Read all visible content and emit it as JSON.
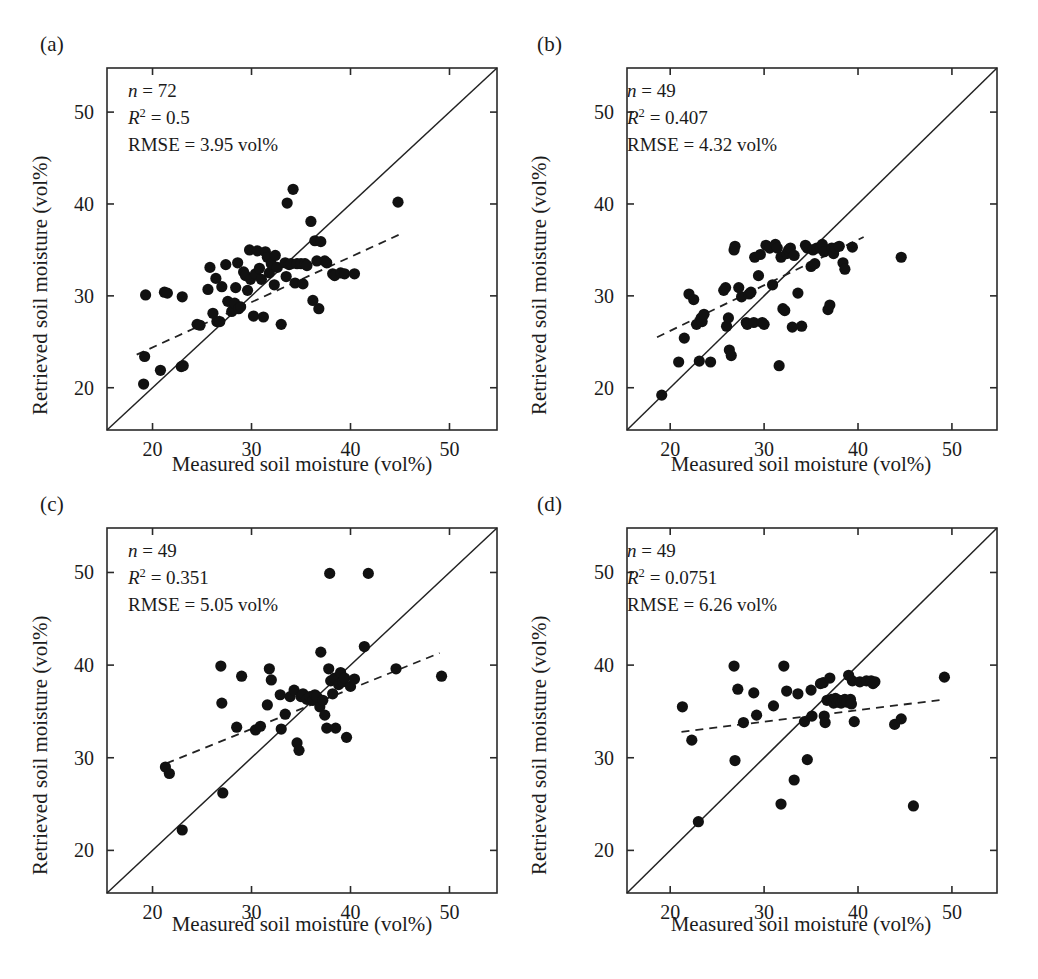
{
  "figure": {
    "panel_count": 4,
    "background_color": "#ffffff",
    "point_color": "#111111",
    "line_color": "#222222"
  },
  "axes": {
    "xlabel": "Measured soil moisture (vol%)",
    "ylabel": "Retrieved soil moisture (vol%)",
    "xticks": [
      "20",
      "30",
      "40",
      "50"
    ],
    "yticks": [
      "20",
      "30",
      "40",
      "50"
    ],
    "xlim": [
      15.4,
      54.8
    ],
    "ylim": [
      15.4,
      54.8
    ]
  },
  "labels": {
    "a": "(a)",
    "b": "(b)",
    "c": "(c)",
    "d": "(d)"
  },
  "stats": {
    "a": {
      "n_label": "n",
      "n_value": "= 72",
      "r2_label": "R",
      "r2_value": "= 0.5",
      "rmse": "RMSE = 3.95 vol%"
    },
    "b": {
      "n_label": "n",
      "n_value": "= 49",
      "r2_label": "R",
      "r2_value": "= 0.407",
      "rmse": "RMSE = 4.32 vol%"
    },
    "c": {
      "n_label": "n",
      "n_value": "= 49",
      "r2_label": "R",
      "r2_value": "= 0.351",
      "rmse": "RMSE = 5.05 vol%"
    },
    "d": {
      "n_label": "n",
      "n_value": "= 49",
      "r2_label": "R",
      "r2_value": "= 0.0751",
      "rmse": "RMSE = 6.26 vol%"
    }
  },
  "chart_data": [
    {
      "id": "a",
      "type": "scatter",
      "title": "(a)",
      "xlabel": "Measured soil moisture (vol%)",
      "ylabel": "Retrieved soil moisture (vol%)",
      "xlim": [
        15.4,
        54.8
      ],
      "ylim": [
        15.4,
        54.8
      ],
      "xticks": [
        20,
        30,
        40,
        50
      ],
      "yticks": [
        20,
        30,
        40,
        50
      ],
      "grid": false,
      "legend": null,
      "n": 72,
      "r_squared": 0.5,
      "rmse": 3.95,
      "rmse_units": "vol%",
      "one_to_one_line": {
        "from": [
          15.4,
          15.4
        ],
        "to": [
          54.8,
          54.8
        ],
        "style": "solid"
      },
      "fit_line": {
        "from": [
          18.4,
          23.6
        ],
        "to": [
          45.2,
          36.8
        ],
        "style": "dashed"
      },
      "points": [
        [
          19.1,
          20.4
        ],
        [
          19.2,
          23.4
        ],
        [
          19.3,
          30.1
        ],
        [
          20.8,
          21.9
        ],
        [
          21.2,
          30.4
        ],
        [
          21.5,
          30.3
        ],
        [
          22.9,
          22.3
        ],
        [
          23.0,
          29.9
        ],
        [
          23.1,
          22.4
        ],
        [
          24.5,
          26.9
        ],
        [
          24.8,
          26.8
        ],
        [
          25.6,
          30.7
        ],
        [
          25.8,
          33.1
        ],
        [
          26.1,
          28.1
        ],
        [
          26.4,
          31.9
        ],
        [
          26.5,
          27.2
        ],
        [
          26.8,
          27.2
        ],
        [
          27.0,
          31.0
        ],
        [
          27.4,
          33.4
        ],
        [
          27.6,
          29.4
        ],
        [
          28.0,
          28.3
        ],
        [
          28.2,
          28.6
        ],
        [
          28.3,
          29.2
        ],
        [
          28.4,
          30.9
        ],
        [
          28.6,
          33.6
        ],
        [
          28.7,
          28.6
        ],
        [
          28.9,
          28.8
        ],
        [
          29.2,
          32.6
        ],
        [
          29.4,
          32.2
        ],
        [
          29.6,
          30.6
        ],
        [
          29.8,
          35.0
        ],
        [
          29.9,
          31.8
        ],
        [
          30.2,
          27.8
        ],
        [
          30.4,
          32.4
        ],
        [
          30.6,
          34.9
        ],
        [
          30.8,
          33.0
        ],
        [
          31.0,
          31.8
        ],
        [
          31.2,
          27.7
        ],
        [
          31.4,
          34.8
        ],
        [
          31.6,
          34.2
        ],
        [
          31.8,
          32.5
        ],
        [
          32.0,
          33.5
        ],
        [
          32.3,
          31.2
        ],
        [
          32.4,
          34.4
        ],
        [
          32.6,
          33.1
        ],
        [
          33.0,
          26.9
        ],
        [
          33.4,
          33.6
        ],
        [
          33.5,
          32.1
        ],
        [
          33.6,
          40.1
        ],
        [
          33.8,
          33.4
        ],
        [
          34.0,
          33.5
        ],
        [
          34.2,
          41.6
        ],
        [
          34.4,
          31.4
        ],
        [
          34.6,
          33.5
        ],
        [
          35.0,
          33.5
        ],
        [
          35.2,
          31.3
        ],
        [
          35.4,
          33.5
        ],
        [
          35.6,
          33.3
        ],
        [
          36.0,
          38.1
        ],
        [
          36.2,
          29.5
        ],
        [
          36.4,
          36.0
        ],
        [
          36.6,
          33.8
        ],
        [
          36.8,
          28.6
        ],
        [
          37.0,
          35.9
        ],
        [
          37.4,
          33.8
        ],
        [
          37.6,
          33.6
        ],
        [
          38.2,
          32.4
        ],
        [
          38.4,
          32.2
        ],
        [
          39.0,
          32.5
        ],
        [
          39.4,
          32.4
        ],
        [
          40.4,
          32.4
        ],
        [
          44.8,
          40.2
        ]
      ]
    },
    {
      "id": "b",
      "type": "scatter",
      "title": "(b)",
      "xlabel": "Measured soil moisture (vol%)",
      "ylabel": "Retrieved soil moisture (vol%)",
      "xlim": [
        15.4,
        54.8
      ],
      "ylim": [
        15.4,
        54.8
      ],
      "xticks": [
        20,
        30,
        40,
        50
      ],
      "yticks": [
        20,
        30,
        40,
        50
      ],
      "grid": false,
      "legend": null,
      "n": 49,
      "r_squared": 0.407,
      "rmse": 4.32,
      "rmse_units": "vol%",
      "one_to_one_line": {
        "from": [
          15.4,
          15.4
        ],
        "to": [
          54.8,
          54.8
        ],
        "style": "solid"
      },
      "fit_line": {
        "from": [
          18.6,
          25.5
        ],
        "to": [
          40.6,
          36.4
        ],
        "style": "dashed"
      },
      "points": [
        [
          19.1,
          19.2
        ],
        [
          20.9,
          22.8
        ],
        [
          21.5,
          25.4
        ],
        [
          22.0,
          30.2
        ],
        [
          22.5,
          29.6
        ],
        [
          22.8,
          26.9
        ],
        [
          23.1,
          22.9
        ],
        [
          23.3,
          27.6
        ],
        [
          23.4,
          27.2
        ],
        [
          23.6,
          28.0
        ],
        [
          24.3,
          22.8
        ],
        [
          25.7,
          30.6
        ],
        [
          25.9,
          30.9
        ],
        [
          26.0,
          26.7
        ],
        [
          26.2,
          27.6
        ],
        [
          26.3,
          24.1
        ],
        [
          26.5,
          23.5
        ],
        [
          26.8,
          35.0
        ],
        [
          26.9,
          35.4
        ],
        [
          27.3,
          30.9
        ],
        [
          27.6,
          29.9
        ],
        [
          28.1,
          27.1
        ],
        [
          28.2,
          26.9
        ],
        [
          28.4,
          30.2
        ],
        [
          28.6,
          30.4
        ],
        [
          28.9,
          27.1
        ],
        [
          29.0,
          34.2
        ],
        [
          29.4,
          32.2
        ],
        [
          29.6,
          34.5
        ],
        [
          29.8,
          27.1
        ],
        [
          30.0,
          26.9
        ],
        [
          30.2,
          35.5
        ],
        [
          30.6,
          35.2
        ],
        [
          30.9,
          31.2
        ],
        [
          31.2,
          35.6
        ],
        [
          31.4,
          35.2
        ],
        [
          31.6,
          22.4
        ],
        [
          31.8,
          34.2
        ],
        [
          32.0,
          28.6
        ],
        [
          32.2,
          28.4
        ],
        [
          32.4,
          34.6
        ],
        [
          32.6,
          35.0
        ],
        [
          32.8,
          35.2
        ],
        [
          33.0,
          26.6
        ],
        [
          33.2,
          34.4
        ],
        [
          33.6,
          30.3
        ],
        [
          34.0,
          26.7
        ],
        [
          34.4,
          35.5
        ],
        [
          34.6,
          35.2
        ],
        [
          35.0,
          33.2
        ],
        [
          35.2,
          35.0
        ],
        [
          35.4,
          33.5
        ],
        [
          35.6,
          35.2
        ],
        [
          36.0,
          35.2
        ],
        [
          36.2,
          35.6
        ],
        [
          36.4,
          34.8
        ],
        [
          36.8,
          28.5
        ],
        [
          37.0,
          29.0
        ],
        [
          37.2,
          35.2
        ],
        [
          37.4,
          34.6
        ],
        [
          37.6,
          35.2
        ],
        [
          38.0,
          35.4
        ],
        [
          38.4,
          33.6
        ],
        [
          38.6,
          32.9
        ],
        [
          39.4,
          35.3
        ],
        [
          44.6,
          34.2
        ]
      ]
    },
    {
      "id": "c",
      "type": "scatter",
      "title": "(c)",
      "xlabel": "Measured soil moisture (vol%)",
      "ylabel": "Retrieved soil moisture (vol%)",
      "xlim": [
        15.4,
        54.8
      ],
      "ylim": [
        15.4,
        54.8
      ],
      "xticks": [
        20,
        30,
        40,
        50
      ],
      "yticks": [
        20,
        30,
        40,
        50
      ],
      "grid": false,
      "legend": null,
      "n": 49,
      "r_squared": 0.351,
      "rmse": 5.05,
      "rmse_units": "vol%",
      "one_to_one_line": {
        "from": [
          15.4,
          15.4
        ],
        "to": [
          54.8,
          54.8
        ],
        "style": "solid"
      },
      "fit_line": {
        "from": [
          21.4,
          29.4
        ],
        "to": [
          49.0,
          41.3
        ],
        "style": "dashed"
      },
      "points": [
        [
          21.3,
          29.0
        ],
        [
          21.7,
          28.3
        ],
        [
          23.0,
          22.2
        ],
        [
          26.9,
          39.9
        ],
        [
          27.0,
          35.9
        ],
        [
          27.1,
          26.2
        ],
        [
          28.5,
          33.3
        ],
        [
          29.0,
          38.8
        ],
        [
          30.4,
          33.0
        ],
        [
          30.9,
          33.4
        ],
        [
          31.6,
          35.7
        ],
        [
          31.8,
          39.6
        ],
        [
          32.0,
          38.4
        ],
        [
          32.9,
          36.8
        ],
        [
          33.0,
          33.1
        ],
        [
          33.4,
          34.7
        ],
        [
          33.9,
          36.6
        ],
        [
          34.3,
          37.3
        ],
        [
          34.6,
          31.6
        ],
        [
          34.8,
          30.8
        ],
        [
          35.0,
          36.6
        ],
        [
          35.2,
          36.9
        ],
        [
          35.6,
          36.3
        ],
        [
          35.9,
          36.6
        ],
        [
          36.2,
          36.2
        ],
        [
          36.4,
          36.8
        ],
        [
          36.6,
          36.6
        ],
        [
          36.9,
          35.5
        ],
        [
          37.0,
          41.4
        ],
        [
          37.2,
          36.2
        ],
        [
          37.4,
          34.6
        ],
        [
          37.6,
          33.2
        ],
        [
          37.8,
          39.6
        ],
        [
          37.9,
          49.9
        ],
        [
          38.0,
          38.3
        ],
        [
          38.2,
          36.9
        ],
        [
          38.4,
          38.6
        ],
        [
          38.5,
          33.2
        ],
        [
          38.8,
          37.9
        ],
        [
          39.0,
          39.2
        ],
        [
          39.2,
          38.2
        ],
        [
          39.4,
          38.6
        ],
        [
          39.6,
          32.2
        ],
        [
          40.0,
          37.7
        ],
        [
          40.4,
          38.5
        ],
        [
          41.4,
          42.0
        ],
        [
          41.8,
          49.9
        ],
        [
          44.6,
          39.6
        ],
        [
          49.2,
          38.8
        ]
      ]
    },
    {
      "id": "d",
      "type": "scatter",
      "title": "(d)",
      "xlabel": "Measured soil moisture (vol%)",
      "ylabel": "Retrieved soil moisture (vol%)",
      "xlim": [
        15.4,
        54.8
      ],
      "ylim": [
        15.4,
        54.8
      ],
      "xticks": [
        20,
        30,
        40,
        50
      ],
      "yticks": [
        20,
        30,
        40,
        50
      ],
      "grid": false,
      "legend": null,
      "n": 49,
      "r_squared": 0.0751,
      "rmse": 6.26,
      "rmse_units": "vol%",
      "one_to_one_line": {
        "from": [
          15.4,
          15.4
        ],
        "to": [
          54.8,
          54.8
        ],
        "style": "solid"
      },
      "fit_line": {
        "from": [
          21.2,
          32.8
        ],
        "to": [
          49.3,
          36.3
        ],
        "style": "dashed"
      },
      "points": [
        [
          21.3,
          35.5
        ],
        [
          22.3,
          31.9
        ],
        [
          23.0,
          23.1
        ],
        [
          26.8,
          39.9
        ],
        [
          26.9,
          29.7
        ],
        [
          27.2,
          37.4
        ],
        [
          27.8,
          33.8
        ],
        [
          28.9,
          37.0
        ],
        [
          29.2,
          34.6
        ],
        [
          31.0,
          35.6
        ],
        [
          31.8,
          25.0
        ],
        [
          32.1,
          39.9
        ],
        [
          32.4,
          37.2
        ],
        [
          33.2,
          27.6
        ],
        [
          33.6,
          36.9
        ],
        [
          34.3,
          33.9
        ],
        [
          34.6,
          29.8
        ],
        [
          35.0,
          37.3
        ],
        [
          35.1,
          34.5
        ],
        [
          36.0,
          38.0
        ],
        [
          36.3,
          38.1
        ],
        [
          36.4,
          34.5
        ],
        [
          36.5,
          33.8
        ],
        [
          36.7,
          36.2
        ],
        [
          37.0,
          38.6
        ],
        [
          37.2,
          36.3
        ],
        [
          37.4,
          35.9
        ],
        [
          37.6,
          36.4
        ],
        [
          37.8,
          36.0
        ],
        [
          38.0,
          36.2
        ],
        [
          38.2,
          35.9
        ],
        [
          38.4,
          36.2
        ],
        [
          38.6,
          36.3
        ],
        [
          38.8,
          36.0
        ],
        [
          39.0,
          38.9
        ],
        [
          39.2,
          36.3
        ],
        [
          39.3,
          35.8
        ],
        [
          39.4,
          38.3
        ],
        [
          39.6,
          33.9
        ],
        [
          40.2,
          38.2
        ],
        [
          40.9,
          38.3
        ],
        [
          41.4,
          38.3
        ],
        [
          41.6,
          38.0
        ],
        [
          41.8,
          38.2
        ],
        [
          43.9,
          33.6
        ],
        [
          44.6,
          34.2
        ],
        [
          45.9,
          24.8
        ],
        [
          49.2,
          38.7
        ]
      ]
    }
  ]
}
